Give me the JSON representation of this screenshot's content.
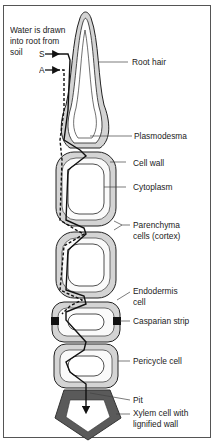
{
  "diagram": {
    "type": "root water uptake pathways",
    "intro_text": [
      "Water is drawn",
      "into root from",
      "soil"
    ],
    "pathways": [
      {
        "key": "S",
        "label": "S",
        "style": "solid arrow (symplast)"
      },
      {
        "key": "A",
        "label": "A",
        "style": "dashed arrow (apoplast)"
      }
    ],
    "labels": [
      {
        "id": "root-hair",
        "lines": [
          "Root hair"
        ]
      },
      {
        "id": "plasmodesma",
        "lines": [
          "Plasmodesma"
        ]
      },
      {
        "id": "cell-wall",
        "lines": [
          "Cell wall"
        ]
      },
      {
        "id": "cytoplasm",
        "lines": [
          "Cytoplasm"
        ]
      },
      {
        "id": "parenchyma",
        "lines": [
          "Parenchyma",
          "cells (cortex)"
        ]
      },
      {
        "id": "endodermis",
        "lines": [
          "Endodermis",
          "cell"
        ]
      },
      {
        "id": "casparian",
        "lines": [
          "Casparian strip"
        ]
      },
      {
        "id": "pericycle",
        "lines": [
          "Pericycle cell"
        ]
      },
      {
        "id": "pit",
        "lines": [
          "Pit"
        ]
      },
      {
        "id": "xylem",
        "lines": [
          "Xylem cell with",
          "lignified wall"
        ]
      }
    ],
    "colors": {
      "cell_wall": "#d4d4d4",
      "outline": "#222222",
      "xylem_wall": "#5a5a5a",
      "casparian": "#111111",
      "background": "#ffffff"
    }
  }
}
